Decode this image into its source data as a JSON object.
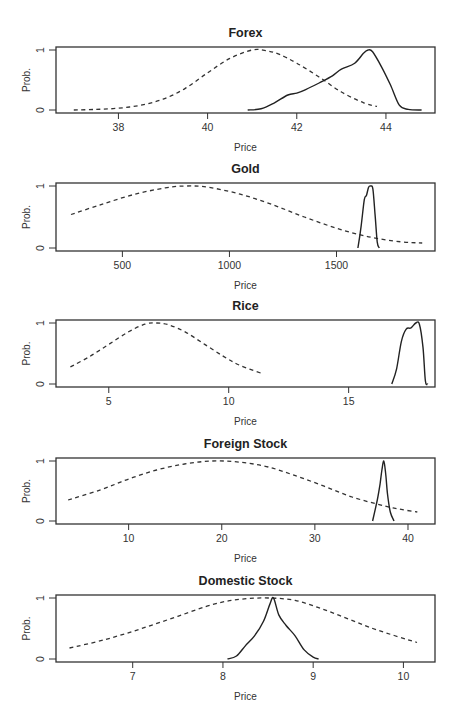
{
  "figure": {
    "y_axis_label": "Prob.",
    "x_axis_label": "Price",
    "y_ticks": [
      "0",
      "1"
    ]
  },
  "chart_data": [
    {
      "type": "line",
      "title": "Forex",
      "xlabel": "Price",
      "ylabel": "Prob.",
      "xlim": [
        36.6,
        45.1
      ],
      "ylim": [
        0,
        1
      ],
      "x_ticks": [
        38,
        40,
        42,
        44
      ],
      "y_ticks": [
        0,
        1
      ],
      "box": {
        "left": 56,
        "right": 435,
        "top": 47,
        "bottom": 113
      },
      "series": [
        {
          "name": "dashed (prior)",
          "style": "dashed",
          "x": [
            37.0,
            37.5,
            38.0,
            38.5,
            39.0,
            39.5,
            40.0,
            40.5,
            41.0,
            41.3,
            41.6,
            42.0,
            42.5,
            43.0,
            43.5,
            43.8
          ],
          "y": [
            0.0,
            0.01,
            0.03,
            0.08,
            0.18,
            0.36,
            0.62,
            0.86,
            1.0,
            0.99,
            0.93,
            0.78,
            0.55,
            0.3,
            0.12,
            0.06
          ]
        },
        {
          "name": "solid (posterior)",
          "style": "solid",
          "x": [
            40.9,
            41.2,
            41.5,
            41.8,
            42.0,
            42.2,
            42.5,
            42.8,
            43.0,
            43.3,
            43.5,
            43.6,
            43.7,
            43.9,
            44.1,
            44.3,
            44.5,
            44.8
          ],
          "y": [
            0.0,
            0.02,
            0.12,
            0.25,
            0.28,
            0.34,
            0.45,
            0.57,
            0.68,
            0.78,
            0.95,
            1.0,
            0.97,
            0.72,
            0.42,
            0.08,
            0.01,
            0.0
          ]
        }
      ]
    },
    {
      "type": "line",
      "title": "Gold",
      "xlabel": "Price",
      "ylabel": "Prob.",
      "xlim": [
        190,
        1960
      ],
      "ylim": [
        0,
        1
      ],
      "x_ticks": [
        500,
        1000,
        1500
      ],
      "y_ticks": [
        0,
        1
      ],
      "box": {
        "left": 56,
        "right": 435,
        "top": 183,
        "bottom": 251
      },
      "series": [
        {
          "name": "dashed (prior)",
          "style": "dashed",
          "x": [
            260,
            400,
            550,
            700,
            800,
            900,
            1050,
            1200,
            1350,
            1500,
            1650,
            1800,
            1900
          ],
          "y": [
            0.54,
            0.7,
            0.86,
            0.97,
            1.0,
            0.98,
            0.87,
            0.7,
            0.5,
            0.32,
            0.18,
            0.1,
            0.08
          ]
        },
        {
          "name": "solid (posterior)",
          "style": "solid",
          "x": [
            1600,
            1615,
            1630,
            1640,
            1650,
            1660,
            1670,
            1680,
            1690,
            1700
          ],
          "y": [
            0.0,
            0.35,
            0.78,
            0.85,
            0.98,
            1.0,
            0.95,
            0.55,
            0.1,
            0.0
          ]
        }
      ]
    },
    {
      "type": "line",
      "title": "Rice",
      "xlabel": "Price",
      "ylabel": "Prob.",
      "xlim": [
        2.8,
        18.6
      ],
      "ylim": [
        0,
        1
      ],
      "x_ticks": [
        5,
        10,
        15
      ],
      "y_ticks": [
        0,
        1
      ],
      "box": {
        "left": 56,
        "right": 435,
        "top": 320,
        "bottom": 387
      },
      "series": [
        {
          "name": "dashed (prior)",
          "style": "dashed",
          "x": [
            3.4,
            4.2,
            5.0,
            5.8,
            6.5,
            7.0,
            7.5,
            8.2,
            9.0,
            9.8,
            10.5,
            11.4
          ],
          "y": [
            0.28,
            0.45,
            0.65,
            0.85,
            0.98,
            1.0,
            0.97,
            0.85,
            0.65,
            0.45,
            0.3,
            0.17
          ]
        },
        {
          "name": "solid (posterior)",
          "style": "solid",
          "x": [
            16.8,
            17.0,
            17.2,
            17.4,
            17.6,
            17.8,
            17.95,
            18.1,
            18.2,
            18.3
          ],
          "y": [
            0.0,
            0.25,
            0.7,
            0.9,
            0.92,
            1.0,
            0.98,
            0.6,
            0.05,
            0.0
          ]
        }
      ]
    },
    {
      "type": "line",
      "title": "Foreign Stock",
      "xlabel": "Price",
      "ylabel": "Prob.",
      "xlim": [
        2.2,
        42.9
      ],
      "ylim": [
        0,
        1
      ],
      "x_ticks": [
        10,
        20,
        30,
        40
      ],
      "y_ticks": [
        0,
        1
      ],
      "box": {
        "left": 56,
        "right": 435,
        "top": 458,
        "bottom": 524
      },
      "series": [
        {
          "name": "dashed (prior)",
          "style": "dashed",
          "x": [
            3.5,
            7,
            10,
            13,
            16,
            19,
            22,
            25,
            28,
            31,
            34,
            37,
            39,
            41
          ],
          "y": [
            0.35,
            0.52,
            0.7,
            0.85,
            0.95,
            1.0,
            0.98,
            0.9,
            0.75,
            0.58,
            0.4,
            0.27,
            0.2,
            0.15
          ]
        },
        {
          "name": "solid (posterior)",
          "style": "solid",
          "x": [
            36.2,
            36.7,
            37.0,
            37.2,
            37.4,
            37.6,
            37.8,
            38.1,
            38.5
          ],
          "y": [
            0.0,
            0.35,
            0.62,
            0.85,
            1.0,
            0.8,
            0.45,
            0.15,
            0.0
          ]
        }
      ]
    },
    {
      "type": "line",
      "title": "Domestic Stock",
      "xlabel": "Price",
      "ylabel": "Prob.",
      "xlim": [
        6.15,
        10.35
      ],
      "ylim": [
        0,
        1
      ],
      "x_ticks": [
        7,
        8,
        9,
        10
      ],
      "y_ticks": [
        0,
        1
      ],
      "box": {
        "left": 56,
        "right": 435,
        "top": 595,
        "bottom": 662
      },
      "series": [
        {
          "name": "dashed (prior)",
          "style": "dashed",
          "x": [
            6.3,
            6.7,
            7.1,
            7.5,
            7.9,
            8.2,
            8.5,
            8.8,
            9.1,
            9.4,
            9.7,
            10.15
          ],
          "y": [
            0.18,
            0.32,
            0.5,
            0.7,
            0.9,
            0.98,
            1.0,
            0.96,
            0.82,
            0.65,
            0.48,
            0.27
          ]
        },
        {
          "name": "solid (posterior)",
          "style": "solid",
          "x": [
            8.05,
            8.15,
            8.25,
            8.35,
            8.45,
            8.52,
            8.56,
            8.62,
            8.7,
            8.8,
            8.9,
            9.0,
            9.06
          ],
          "y": [
            0.0,
            0.05,
            0.22,
            0.38,
            0.62,
            0.9,
            1.0,
            0.72,
            0.55,
            0.38,
            0.15,
            0.03,
            0.0
          ]
        }
      ]
    }
  ]
}
